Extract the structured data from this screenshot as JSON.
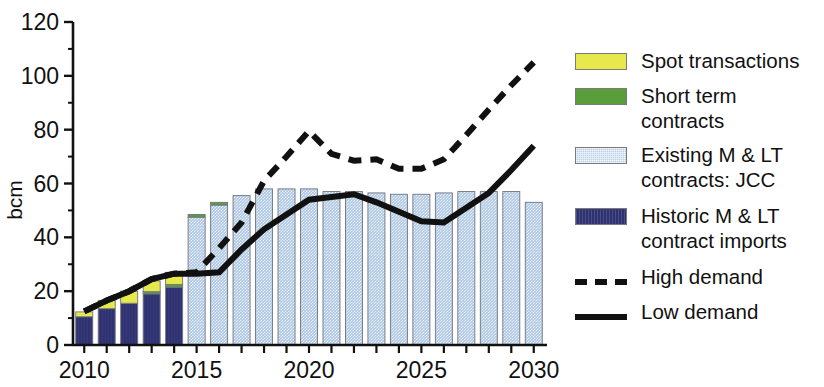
{
  "chart_data": {
    "type": "bar",
    "title": "",
    "subtitle": "",
    "xlabel": "",
    "ylabel": "bcm",
    "xlim": [
      2009.5,
      2030.5
    ],
    "ylim": [
      0,
      120
    ],
    "ytick_values": [
      0,
      20,
      40,
      60,
      80,
      100,
      120
    ],
    "ytick_labels": [
      "0",
      "20",
      "40",
      "60",
      "80",
      "100",
      "120"
    ],
    "yminor_step": 10,
    "xtick_values": [
      2010,
      2011,
      2012,
      2013,
      2014,
      2015,
      2016,
      2017,
      2018,
      2019,
      2020,
      2021,
      2022,
      2023,
      2024,
      2025,
      2026,
      2027,
      2028,
      2029,
      2030
    ],
    "xtick_labels_shown": [
      "2010",
      "2015",
      "2020",
      "2025",
      "2030"
    ],
    "xtick_labels_shown_values": [
      2010,
      2015,
      2020,
      2025,
      2030
    ],
    "grid": false,
    "legend_position": "right",
    "stacked": true,
    "categories": [
      2010,
      2011,
      2012,
      2013,
      2014,
      2015,
      2016,
      2017,
      2018,
      2019,
      2020,
      2021,
      2022,
      2023,
      2024,
      2025,
      2026,
      2027,
      2028,
      2029,
      2030
    ],
    "series": [
      {
        "name": "Historic M & LT contract imports",
        "color": "#2f3270",
        "values": [
          10.5,
          13.5,
          15.5,
          19.0,
          21.5,
          0,
          0,
          0,
          0,
          0,
          0,
          0,
          0,
          0,
          0,
          0,
          0,
          0,
          0,
          0,
          0
        ]
      },
      {
        "name": "Existing M & LT contracts: JCC",
        "color": "#b9cfe8",
        "values": [
          0,
          0,
          0,
          0,
          0,
          47.5,
          52.0,
          55.5,
          58.0,
          58.0,
          58.0,
          57.0,
          57.0,
          56.5,
          56.0,
          56.0,
          56.5,
          57.0,
          57.0,
          57.0,
          53.0
        ]
      },
      {
        "name": "Short term contracts",
        "color": "#5a9e3c",
        "values": [
          0,
          0,
          0,
          0.8,
          1.0,
          1.0,
          1.0,
          0,
          0,
          0,
          0,
          0,
          0,
          0,
          0,
          0,
          0,
          0,
          0,
          0,
          0
        ]
      },
      {
        "name": "Spot transactions",
        "color": "#e6e84c",
        "values": [
          1.8,
          3.0,
          4.5,
          4.0,
          4.5,
          0,
          0,
          0,
          0,
          0,
          0,
          0,
          0,
          0,
          0,
          0,
          0,
          0,
          0,
          0,
          0
        ]
      }
    ],
    "lines": [
      {
        "name": "High demand",
        "style": "dashed",
        "color": "#111111",
        "x": [
          2010,
          2011,
          2012,
          2013,
          2014,
          2015,
          2016,
          2017,
          2018,
          2019,
          2020,
          2021,
          2022,
          2023,
          2024,
          2025,
          2026,
          2027,
          2028,
          2029,
          2030
        ],
        "y": [
          12.5,
          16.5,
          20.0,
          24.5,
          26.5,
          27.0,
          36.0,
          45.5,
          61.0,
          70.0,
          79.5,
          71.0,
          68.5,
          69.0,
          65.5,
          65.5,
          69.0,
          78.0,
          87.5,
          96.5,
          105.0
        ]
      },
      {
        "name": "Low demand",
        "style": "solid",
        "color": "#111111",
        "x": [
          2010,
          2011,
          2012,
          2013,
          2014,
          2015,
          2016,
          2017,
          2018,
          2019,
          2020,
          2021,
          2022,
          2023,
          2024,
          2025,
          2026,
          2027,
          2028,
          2029,
          2030
        ],
        "y": [
          12.5,
          16.5,
          20.0,
          24.5,
          26.5,
          26.5,
          27.0,
          35.5,
          43.0,
          48.5,
          54.0,
          55.0,
          56.0,
          53.0,
          49.5,
          46.0,
          45.5,
          51.0,
          56.5,
          65.0,
          74.0
        ]
      }
    ]
  },
  "axis": {
    "ylabel": "bcm",
    "ytick_labels": [
      "0",
      "20",
      "40",
      "60",
      "80",
      "100",
      "120"
    ],
    "xtick_labels": [
      "2010",
      "2015",
      "2020",
      "2025",
      "2030"
    ]
  },
  "legend": {
    "items": [
      {
        "label": "Spot transactions",
        "swatch": "yellow",
        "color": "#e6e84c",
        "kind": "box"
      },
      {
        "label": "Short term contracts",
        "swatch": "green",
        "color": "#5a9e3c",
        "kind": "box"
      },
      {
        "label": "Existing M & LT\ncontracts: JCC",
        "swatch": "hatch-blue",
        "color": "#b9cfe8",
        "kind": "box"
      },
      {
        "label": "Historic M & LT\ncontract imports",
        "swatch": "navy",
        "color": "#2f3270",
        "kind": "box"
      },
      {
        "label": "High demand",
        "swatch": "dashed-line",
        "color": "#111111",
        "kind": "dashed"
      },
      {
        "label": "Low demand",
        "swatch": "solid-line",
        "color": "#111111",
        "kind": "solid"
      }
    ]
  }
}
